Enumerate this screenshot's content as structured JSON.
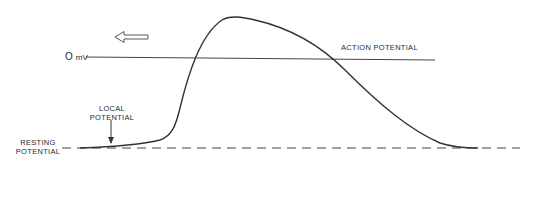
{
  "diagram": {
    "labels": {
      "zero_mv_value": "O",
      "zero_mv_unit": "mV",
      "action_potential": "ACTION POTENTIAL",
      "local_potential_line1": "LOCAL",
      "local_potential_line2": "POTENTIAL",
      "resting_potential_line1": "RESTING",
      "resting_potential_line2": "POTENTIAL"
    },
    "icons": {
      "direction_arrow": "hollow-left-arrow",
      "local_marker": "down-arrow"
    },
    "colors": {
      "line": "#333333",
      "background": "#ffffff"
    }
  }
}
